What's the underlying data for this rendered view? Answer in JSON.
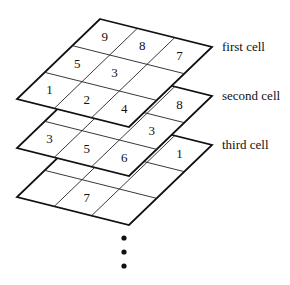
{
  "diagram": {
    "type": "stacked-cells",
    "cells": [
      {
        "label": "first cell",
        "numbers": [
          {
            "row": 0,
            "col": 0,
            "value": "9"
          },
          {
            "row": 0,
            "col": 1,
            "value": "8"
          },
          {
            "row": 0,
            "col": 2,
            "value": "7"
          },
          {
            "row": 1,
            "col": 0,
            "value": "5"
          },
          {
            "row": 1,
            "col": 1,
            "value": "3"
          },
          {
            "row": 2,
            "col": 0,
            "value": "1"
          },
          {
            "row": 2,
            "col": 1,
            "value": "2"
          },
          {
            "row": 2,
            "col": 2,
            "value": "4"
          }
        ]
      },
      {
        "label": "second cell",
        "numbers": [
          {
            "row": 0,
            "col": 2,
            "value": "8"
          },
          {
            "row": 1,
            "col": 2,
            "value": "3"
          },
          {
            "row": 2,
            "col": 0,
            "value": "3"
          },
          {
            "row": 2,
            "col": 1,
            "value": "5"
          },
          {
            "row": 2,
            "col": 2,
            "value": "6"
          }
        ]
      },
      {
        "label": "third cell",
        "numbers": [
          {
            "row": 0,
            "col": 2,
            "value": "1"
          },
          {
            "row": 2,
            "col": 1,
            "value": "7"
          }
        ]
      }
    ],
    "continuation": "⋮"
  }
}
